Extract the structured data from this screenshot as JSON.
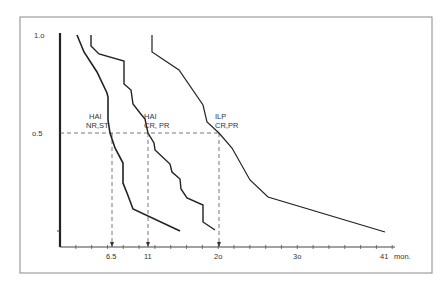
{
  "chart_data": {
    "type": "line",
    "title": "",
    "xlabel": "mon.",
    "ylabel": "",
    "xlim": [
      0,
      41
    ],
    "ylim": [
      0,
      1.0
    ],
    "grid": false,
    "legend": "inline labels",
    "y_ticks": [
      {
        "value": 1.0,
        "label": "1.o"
      },
      {
        "value": 0.5,
        "label": "o.5"
      }
    ],
    "x_ticks": [
      {
        "value": 6.5,
        "label": "6.5"
      },
      {
        "value": 11,
        "label": "11"
      },
      {
        "value": 20,
        "label": "2o"
      },
      {
        "value": 30,
        "label": "3o"
      },
      {
        "value": 41,
        "label": "41"
      }
    ],
    "x_unit_label": "mon.",
    "reference_line": {
      "y": 0.5,
      "style": "dashed",
      "drops_at_x": [
        6.5,
        11,
        20
      ]
    },
    "series": [
      {
        "name": "HAI NR,ST",
        "label_lines": [
          "HAI",
          "NR,ST"
        ],
        "median": 6.5,
        "points": [
          [
            2.1,
            1.0
          ],
          [
            3.0,
            0.91
          ],
          [
            4.6,
            0.81
          ],
          [
            5.9,
            0.7
          ],
          [
            6.0,
            0.68
          ],
          [
            6.0,
            0.56
          ],
          [
            6.3,
            0.5
          ],
          [
            6.9,
            0.42
          ],
          [
            7.9,
            0.35
          ],
          [
            7.9,
            0.24
          ],
          [
            8.4,
            0.19
          ],
          [
            9.2,
            0.11
          ],
          [
            15.1,
            0.0
          ]
        ]
      },
      {
        "name": "HAI CR,PR",
        "label_lines": [
          "HAI",
          "CR, PR"
        ],
        "median": 11,
        "points": [
          [
            3.9,
            1.0
          ],
          [
            3.9,
            0.94
          ],
          [
            4.9,
            0.9
          ],
          [
            8.0,
            0.87
          ],
          [
            8.0,
            0.75
          ],
          [
            8.9,
            0.72
          ],
          [
            9.1,
            0.65
          ],
          [
            10.0,
            0.6
          ],
          [
            10.6,
            0.57
          ],
          [
            11.0,
            0.5
          ],
          [
            11.8,
            0.45
          ],
          [
            11.9,
            0.42
          ],
          [
            13.8,
            0.34
          ],
          [
            14.0,
            0.3
          ],
          [
            15.1,
            0.27
          ],
          [
            15.2,
            0.22
          ],
          [
            16.0,
            0.17
          ],
          [
            18.0,
            0.13
          ],
          [
            18.0,
            0.05
          ],
          [
            19.5,
            0.01
          ]
        ]
      },
      {
        "name": "ILP CR,PR",
        "label_lines": [
          "ILP",
          "CR,PR"
        ],
        "median": 20,
        "points": [
          [
            11.6,
            1.0
          ],
          [
            11.6,
            0.91
          ],
          [
            15.0,
            0.82
          ],
          [
            18.0,
            0.64
          ],
          [
            18.5,
            0.56
          ],
          [
            20.0,
            0.5
          ],
          [
            21.7,
            0.42
          ],
          [
            23.9,
            0.26
          ],
          [
            26.2,
            0.17
          ],
          [
            41.0,
            0.0
          ]
        ]
      }
    ]
  }
}
